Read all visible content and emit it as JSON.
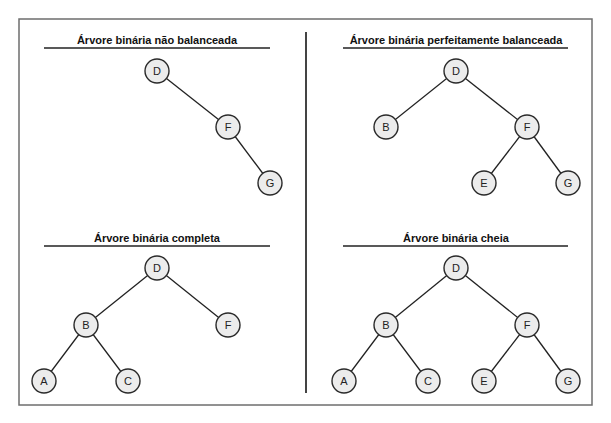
{
  "diagram": {
    "node_radius": 12,
    "colors": {
      "node_fill": "#ececec",
      "node_stroke": "#2a2a2a",
      "edge": "#222222",
      "frame": "#6e6e6e"
    },
    "panels": [
      {
        "id": "unbalanced",
        "title": "Árvore binária não balanceada",
        "title_pos": [
          157,
          40
        ],
        "underline": [
          44,
          48,
          270,
          48
        ],
        "nodes": [
          {
            "label": "D",
            "x": 157,
            "y": 71
          },
          {
            "label": "F",
            "x": 228,
            "y": 127
          },
          {
            "label": "G",
            "x": 270,
            "y": 183
          }
        ],
        "edges": [
          [
            "D",
            "F"
          ],
          [
            "F",
            "G"
          ]
        ]
      },
      {
        "id": "perfectly-balanced",
        "title": "Árvore binária perfeitamente balanceada",
        "title_pos": [
          456,
          40
        ],
        "underline": [
          343,
          48,
          568,
          48
        ],
        "nodes": [
          {
            "label": "D",
            "x": 456,
            "y": 71
          },
          {
            "label": "B",
            "x": 386,
            "y": 127
          },
          {
            "label": "F",
            "x": 527,
            "y": 127
          },
          {
            "label": "E",
            "x": 484,
            "y": 183
          },
          {
            "label": "G",
            "x": 568,
            "y": 183
          }
        ],
        "edges": [
          [
            "D",
            "B"
          ],
          [
            "D",
            "F"
          ],
          [
            "F",
            "E"
          ],
          [
            "F",
            "G"
          ]
        ]
      },
      {
        "id": "complete",
        "title": "Árvore binária completa",
        "title_pos": [
          157,
          238
        ],
        "underline": [
          44,
          246,
          270,
          246
        ],
        "nodes": [
          {
            "label": "D",
            "x": 157,
            "y": 268
          },
          {
            "label": "B",
            "x": 86,
            "y": 325
          },
          {
            "label": "F",
            "x": 228,
            "y": 325
          },
          {
            "label": "A",
            "x": 44,
            "y": 381
          },
          {
            "label": "C",
            "x": 128,
            "y": 381
          }
        ],
        "edges": [
          [
            "D",
            "B"
          ],
          [
            "D",
            "F"
          ],
          [
            "B",
            "A"
          ],
          [
            "B",
            "C"
          ]
        ]
      },
      {
        "id": "full",
        "title": "Árvore binária cheia",
        "title_pos": [
          456,
          238
        ],
        "underline": [
          343,
          246,
          568,
          246
        ],
        "nodes": [
          {
            "label": "D",
            "x": 456,
            "y": 268
          },
          {
            "label": "B",
            "x": 386,
            "y": 325
          },
          {
            "label": "F",
            "x": 527,
            "y": 325
          },
          {
            "label": "A",
            "x": 344,
            "y": 381
          },
          {
            "label": "C",
            "x": 428,
            "y": 381
          },
          {
            "label": "E",
            "x": 484,
            "y": 381
          },
          {
            "label": "G",
            "x": 568,
            "y": 381
          }
        ],
        "edges": [
          [
            "D",
            "B"
          ],
          [
            "D",
            "F"
          ],
          [
            "B",
            "A"
          ],
          [
            "B",
            "C"
          ],
          [
            "F",
            "E"
          ],
          [
            "F",
            "G"
          ]
        ]
      }
    ]
  }
}
